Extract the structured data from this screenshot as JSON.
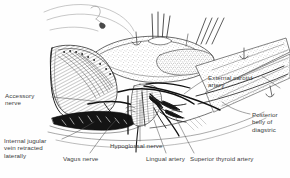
{
  "figure": {
    "kind": "anatomical-line-drawing",
    "style": "black and white pen-and-ink stipple and hatch drawing",
    "background_color": "#fefefe",
    "ink_color": "#1a1a1a",
    "label_color": "#3b3b3b"
  },
  "labels": {
    "accessory_nerve": "Accessory\nnerve",
    "internal_jugular": "Internal jugular\nvein retracted\nlaterally",
    "vagus_nerve": "Vagus nerve",
    "hypoglossal_nerve": "Hypoglossal nerve",
    "lingual_artery": "Lingual artery",
    "superior_thyroid_artery": "Superior thyroid artery",
    "external_carotid_artery": "External carotid\nartery",
    "posterior_belly_digastric": "Posterior\nbelly of\ndiagstric"
  }
}
